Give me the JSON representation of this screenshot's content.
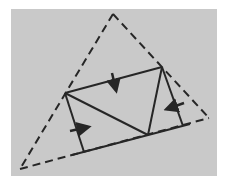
{
  "colors": {
    "page_background": "#ffffff",
    "panel_background": "#c9c9c9",
    "line": "#262626"
  },
  "panel": {
    "x": 11,
    "y": 9,
    "width": 206,
    "height": 167
  },
  "points": {
    "A_apex": [
      113,
      14
    ],
    "B_bottom_left": [
      20,
      169
    ],
    "C_right": [
      209,
      118
    ],
    "P_left_side": [
      65,
      93
    ],
    "Q_right_side": [
      162,
      67
    ],
    "F_bottom_vertex": [
      148,
      135
    ],
    "L_left_foot": [
      84,
      152
    ],
    "R_right_foot": [
      183,
      126
    ]
  },
  "dashed_edges": [
    {
      "name": "outer-edge-left",
      "from": "A_apex",
      "to": "B_bottom_left"
    },
    {
      "name": "outer-edge-right",
      "from": "A_apex",
      "to": "C_right"
    },
    {
      "name": "outer-edge-bottom",
      "from": "B_bottom_left",
      "to": "C_right"
    }
  ],
  "solid_edges": [
    {
      "name": "top-chord",
      "from": "P_left_side",
      "to": "Q_right_side"
    },
    {
      "name": "diagonal-left",
      "from": "P_left_side",
      "to": "F_bottom_vertex"
    },
    {
      "name": "diagonal-right",
      "from": "Q_right_side",
      "to": "F_bottom_vertex"
    },
    {
      "name": "left-perpendicular",
      "from": "P_left_side",
      "to": "L_left_foot"
    },
    {
      "name": "right-perpendicular",
      "from": "Q_right_side",
      "to": "R_right_foot"
    },
    {
      "name": "bottom-solid-segment",
      "from_xy": [
        72,
        155
      ],
      "to_xy": [
        190,
        124
      ]
    }
  ],
  "arrows": [
    {
      "name": "arrow-top-down",
      "from": [
        112,
        73
      ],
      "to": [
        116,
        90
      ]
    },
    {
      "name": "arrow-left-right",
      "from": [
        70,
        131
      ],
      "to": [
        88,
        127
      ]
    },
    {
      "name": "arrow-right-left",
      "from": [
        184,
        103
      ],
      "to": [
        167,
        109
      ]
    }
  ]
}
